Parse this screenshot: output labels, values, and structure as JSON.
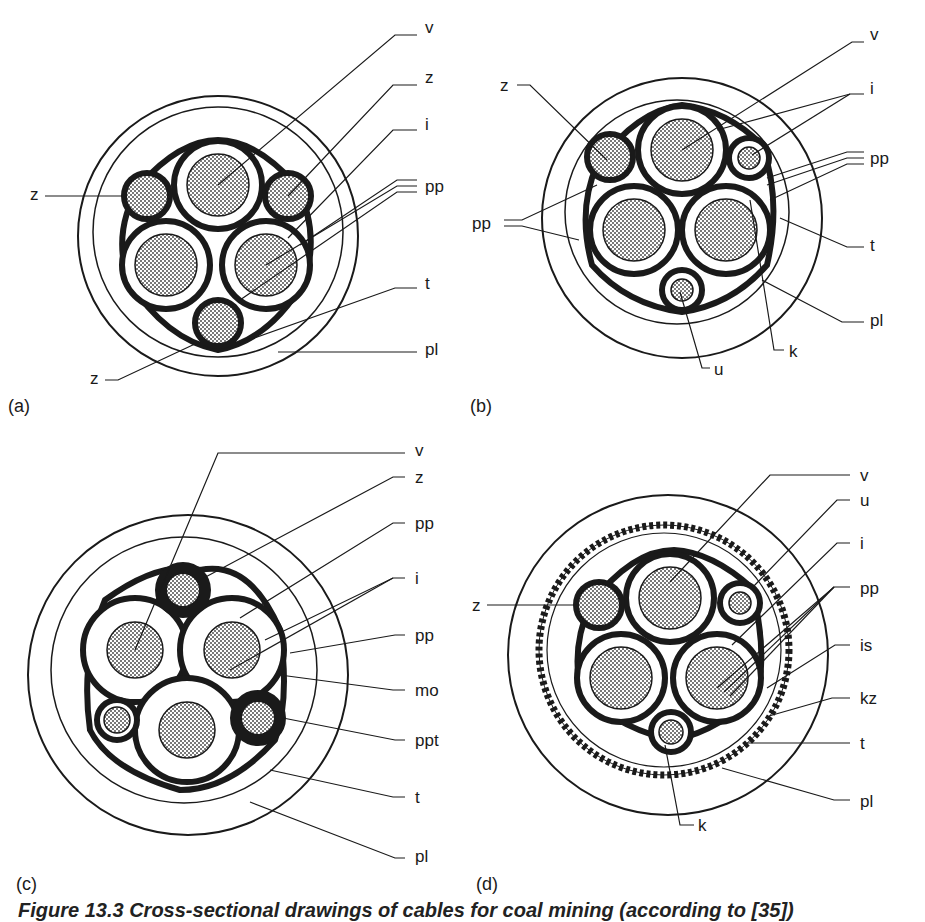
{
  "figure": {
    "caption": "Figure 13.3   Cross-sectional drawings of cables for coal mining (according to [35])",
    "colors": {
      "ink": "#1a1a1a",
      "hatch": "#9a9a9a",
      "background": "#ffffff"
    }
  },
  "panels": [
    {
      "id": "(a)",
      "labels": [
        {
          "text": "v",
          "x": 425,
          "y": 27
        },
        {
          "text": "z",
          "x": 425,
          "y": 77
        },
        {
          "text": "i",
          "x": 425,
          "y": 124
        },
        {
          "text": "pp",
          "x": 425,
          "y": 178
        },
        {
          "text": "t",
          "x": 425,
          "y": 283
        },
        {
          "text": "pl",
          "x": 425,
          "y": 345
        },
        {
          "text": "z",
          "x": 30,
          "y": 188
        },
        {
          "text": "z",
          "x": 90,
          "y": 372
        }
      ]
    },
    {
      "id": "(b)",
      "labels": [
        {
          "text": "v",
          "x": 408,
          "y": 33
        },
        {
          "text": "i",
          "x": 408,
          "y": 87
        },
        {
          "text": "pp",
          "x": 408,
          "y": 152
        },
        {
          "text": "t",
          "x": 408,
          "y": 240
        },
        {
          "text": "pl",
          "x": 408,
          "y": 313
        },
        {
          "text": "k",
          "x": 330,
          "y": 345
        },
        {
          "text": "u",
          "x": 255,
          "y": 362
        },
        {
          "text": "z",
          "x": 40,
          "y": 78
        },
        {
          "text": "pp",
          "x": 10,
          "y": 220
        }
      ]
    },
    {
      "id": "(c)",
      "labels": [
        {
          "text": "v",
          "x": 415,
          "y": 3
        },
        {
          "text": "z",
          "x": 415,
          "y": 28
        },
        {
          "text": "pp",
          "x": 415,
          "y": 75
        },
        {
          "text": "i",
          "x": 415,
          "y": 129
        },
        {
          "text": "pp",
          "x": 415,
          "y": 185
        },
        {
          "text": "mo",
          "x": 415,
          "y": 240
        },
        {
          "text": "ppt",
          "x": 415,
          "y": 291
        },
        {
          "text": "t",
          "x": 415,
          "y": 349
        },
        {
          "text": "pl",
          "x": 415,
          "y": 405
        }
      ]
    },
    {
      "id": "(d)",
      "labels": [
        {
          "text": "v",
          "x": 398,
          "y": 28
        },
        {
          "text": "u",
          "x": 398,
          "y": 52
        },
        {
          "text": "i",
          "x": 398,
          "y": 95
        },
        {
          "text": "pp",
          "x": 398,
          "y": 140
        },
        {
          "text": "is",
          "x": 398,
          "y": 197
        },
        {
          "text": "kz",
          "x": 398,
          "y": 250
        },
        {
          "text": "t",
          "x": 398,
          "y": 295
        },
        {
          "text": "pl",
          "x": 398,
          "y": 353
        },
        {
          "text": "z",
          "x": 10,
          "y": 157
        },
        {
          "text": "k",
          "x": 240,
          "y": 377
        }
      ]
    }
  ]
}
